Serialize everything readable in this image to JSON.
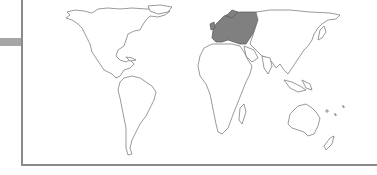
{
  "map": {
    "type": "world-choropleth",
    "projection": "robinson-like",
    "highlighted_region": "Europe",
    "colors": {
      "background": "#ffffff",
      "land_fill": "#ffffff",
      "land_stroke": "#6f6f6f",
      "highlight_fill": "#808080",
      "frame": "#8a8a8a",
      "side_tab": "#a6a6a6"
    },
    "regions": [
      {
        "name": "North America",
        "highlighted": false
      },
      {
        "name": "South America",
        "highlighted": false
      },
      {
        "name": "Europe",
        "highlighted": true
      },
      {
        "name": "Africa",
        "highlighted": false
      },
      {
        "name": "Asia",
        "highlighted": false
      },
      {
        "name": "Oceania",
        "highlighted": false
      }
    ]
  }
}
